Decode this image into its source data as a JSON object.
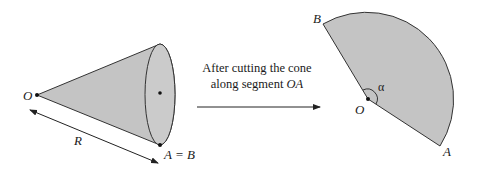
{
  "figure": {
    "cone": {
      "apex_label": "O",
      "rim_point_label": "A = B",
      "slant_label": "R"
    },
    "transition": {
      "line1": "After cutting the cone",
      "line2_prefix": "along segment ",
      "line2_segment": "OA"
    },
    "sector": {
      "center_label": "O",
      "edge_start_label": "A",
      "edge_end_label": "B",
      "angle_label": "α"
    },
    "colors": {
      "fill": "#c4c4c4",
      "stroke": "#333333",
      "background": "#ffffff"
    }
  }
}
